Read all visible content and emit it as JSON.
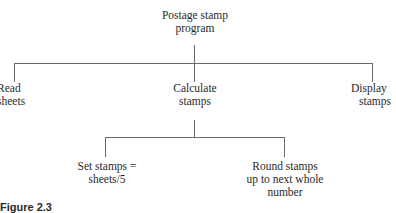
{
  "diagram": {
    "type": "hierarchy-chart",
    "root": {
      "label_lines": [
        "Postage stamp",
        "program"
      ]
    },
    "level1": [
      {
        "label_lines": [
          "Read",
          "sheets"
        ]
      },
      {
        "label_lines": [
          "Calculate",
          "stamps"
        ]
      },
      {
        "label_lines": [
          "Display",
          "stamps"
        ]
      }
    ],
    "level2_under_calculate": [
      {
        "label_lines": [
          "Set stamps =",
          "sheets/5"
        ]
      },
      {
        "label_lines": [
          "Round stamps",
          "up to next whole",
          "number"
        ]
      }
    ],
    "caption": {
      "label": "Figure 2.3",
      "text": ""
    }
  }
}
